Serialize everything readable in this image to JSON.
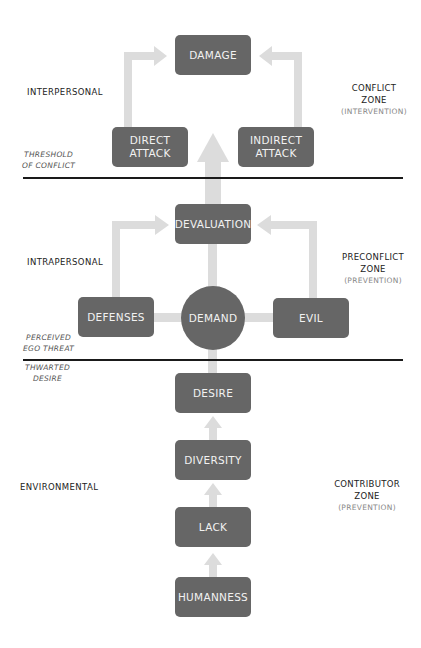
{
  "diagram": {
    "colors": {
      "node": "#666666",
      "node_text": "#f2f2f2",
      "arrow": "#dcdcdc",
      "divider": "#1a1a1a"
    },
    "nodes": {
      "damage": "DAMAGE",
      "direct_attack": [
        "DIRECT",
        "ATTACK"
      ],
      "indirect_attack": [
        "INDIRECT",
        "ATTACK"
      ],
      "devaluation": "DEVALUATION",
      "defenses": "DEFENSES",
      "demand": "DEMAND",
      "evil": "EVIL",
      "desire": "DESIRE",
      "diversity": "DIVERSITY",
      "lack": "LACK",
      "humanness": "HUMANNESS"
    },
    "levels": {
      "interpersonal": "INTERPERSONAL",
      "intrapersonal": "INTRAPERSONAL",
      "environmental": "ENVIRONMENTAL"
    },
    "thresholds": {
      "threshold_of_conflict": [
        "THRESHOLD",
        "OF CONFLICT"
      ],
      "perceived_ego_threat": [
        "PERCEIVED",
        "EGO THREAT"
      ],
      "thwarted_desire": [
        "THWARTED",
        "DESIRE"
      ]
    },
    "zones": {
      "conflict": [
        "CONFLICT",
        "ZONE",
        "(INTERVENTION)"
      ],
      "preconflict": [
        "PRECONFLICT",
        "ZONE",
        "(PREVENTION)"
      ],
      "contributor": [
        "CONTRIBUTOR",
        "ZONE",
        "(PREVENTION)"
      ]
    }
  }
}
